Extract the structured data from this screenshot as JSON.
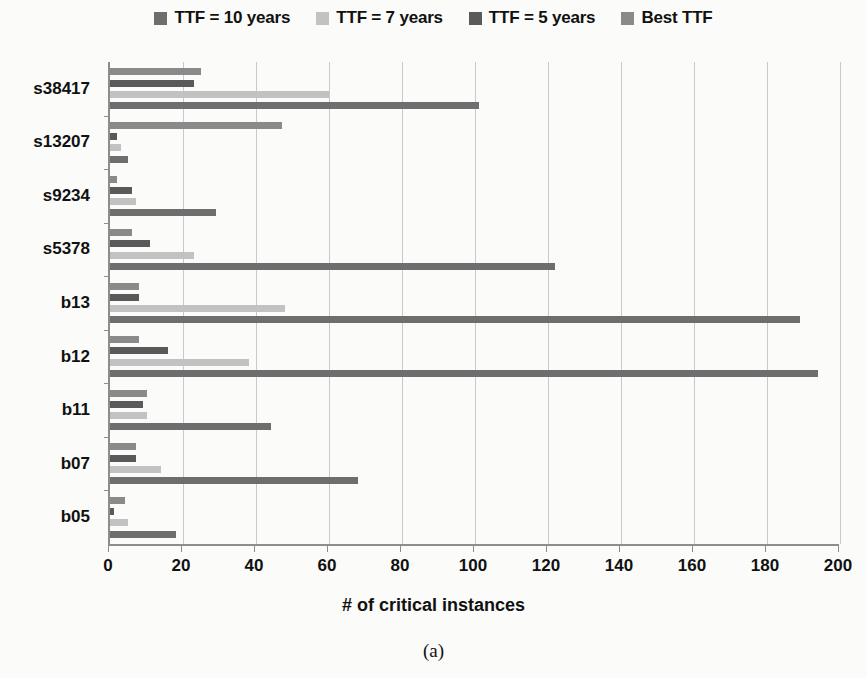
{
  "chart_data": {
    "type": "bar",
    "orientation": "horizontal",
    "title": "",
    "xlabel": "# of critical instances",
    "ylabel": "",
    "xlim": [
      0,
      200
    ],
    "xticks": [
      0,
      20,
      40,
      60,
      80,
      100,
      120,
      140,
      160,
      180,
      200
    ],
    "grid": "vertical",
    "legend_position": "top",
    "categories": [
      "s38417",
      "s13207",
      "s9234",
      "s5378",
      "b13",
      "b12",
      "b11",
      "b07",
      "b05"
    ],
    "series": [
      {
        "name": "TTF = 10 years",
        "color": "#6e6e6e",
        "values": [
          101,
          5,
          29,
          122,
          189,
          194,
          44,
          68,
          18
        ]
      },
      {
        "name": "TTF = 7 years",
        "color": "#c2c2c2",
        "values": [
          60,
          3,
          7,
          23,
          48,
          38,
          10,
          14,
          5
        ]
      },
      {
        "name": "TTF = 5 years",
        "color": "#5a5a5a",
        "values": [
          23,
          2,
          6,
          11,
          8,
          16,
          9,
          7,
          1
        ]
      },
      {
        "name": "Best TTF",
        "color": "#8a8a8a",
        "values": [
          25,
          47,
          2,
          6,
          8,
          8,
          10,
          7,
          4
        ]
      }
    ]
  },
  "legend": {
    "items": [
      {
        "label": "TTF = 10 years",
        "color": "#6e6e6e"
      },
      {
        "label": "TTF = 7 years",
        "color": "#c2c2c2"
      },
      {
        "label": "TTF = 5 years",
        "color": "#5a5a5a"
      },
      {
        "label": "Best TTF",
        "color": "#8a8a8a"
      }
    ]
  },
  "caption": {
    "text": "(a)"
  },
  "axis": {
    "x_title": "# of critical instances"
  }
}
